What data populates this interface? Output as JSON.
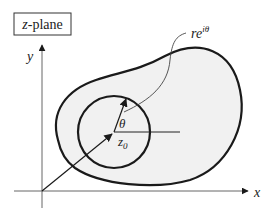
{
  "title_box": {
    "label": "z-plane",
    "italic_part": "z",
    "rest": "-plane"
  },
  "axes": {
    "x_label": "x",
    "y_label": "y"
  },
  "labels": {
    "theta": "θ",
    "center": "z",
    "center_sub": "0",
    "point_r": "re",
    "point_exp": "iθ"
  },
  "colors": {
    "stroke": "#1a1a1a",
    "fill": "#f0f0f0",
    "axis": "#555555"
  }
}
